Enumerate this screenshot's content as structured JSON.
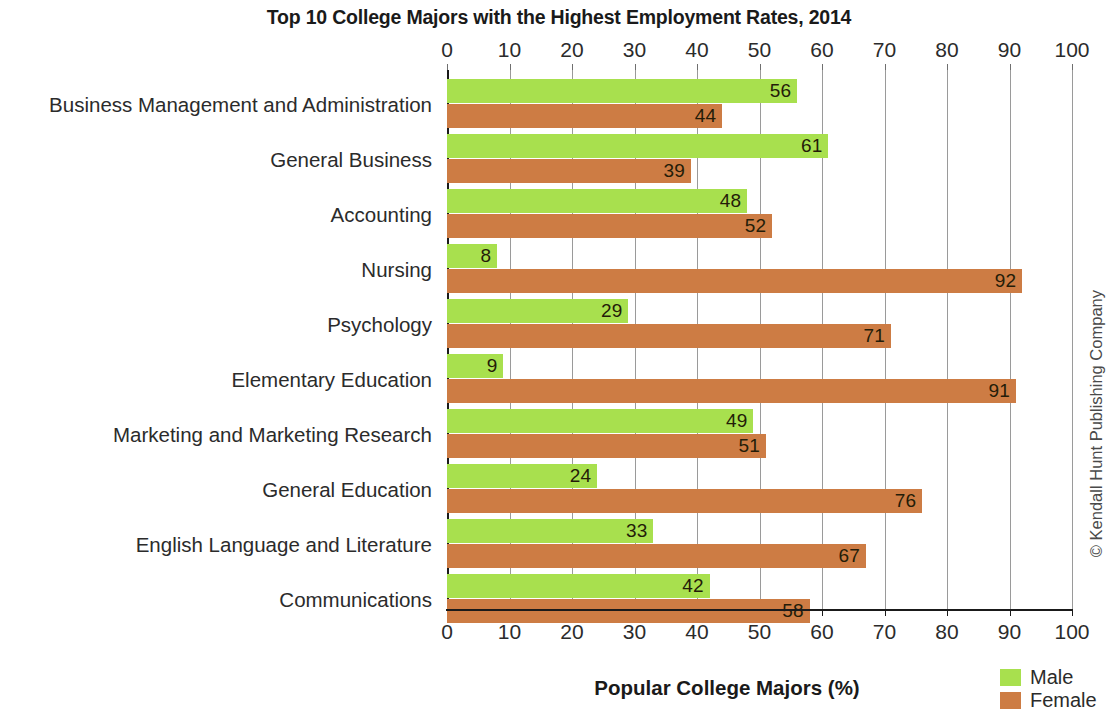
{
  "chart_data": {
    "type": "bar",
    "orientation": "horizontal",
    "title": "Top 10 College Majors with the Highest Employment Rates, 2014",
    "xlabel": "Popular College Majors (%)",
    "ylabel": "",
    "xlim": [
      0,
      100
    ],
    "xticks": [
      0,
      10,
      20,
      30,
      40,
      50,
      60,
      70,
      80,
      90,
      100
    ],
    "xtick_labels": [
      "0",
      "10",
      "20",
      "30",
      "40",
      "50",
      "60",
      "70",
      "80",
      "90",
      "100"
    ],
    "grid": true,
    "grid_axis": "x",
    "axis_duplicated_top": true,
    "legend_position": "bottom-right",
    "categories": [
      "Business Management and Administration",
      "General Business",
      "Accounting",
      "Nursing",
      "Psychology",
      "Elementary Education",
      "Marketing and Marketing Research",
      "General Education",
      "English Language and Literature",
      "Communications"
    ],
    "series": [
      {
        "name": "Male",
        "color": "#a8e04e",
        "values": [
          56,
          61,
          48,
          8,
          29,
          9,
          49,
          24,
          33,
          42
        ]
      },
      {
        "name": "Female",
        "color": "#cd7c44",
        "values": [
          44,
          39,
          52,
          92,
          71,
          91,
          51,
          76,
          67,
          58
        ]
      }
    ],
    "data_labels": true
  },
  "legend": {
    "items": [
      {
        "label": "Male",
        "color": "#a8e04e"
      },
      {
        "label": "Female",
        "color": "#cd7c44"
      }
    ]
  },
  "credit": {
    "text": "© Kendall Hunt Publishing Company"
  }
}
